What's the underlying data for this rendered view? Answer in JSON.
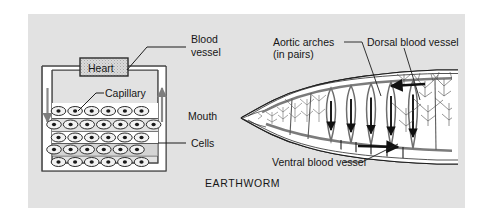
{
  "figure": {
    "caption": "EARTHWORM",
    "panel_color": "#e2e2e2",
    "background_color": "#ffffff",
    "ink_color": "#161616",
    "vessel_color": "#6b6b6b"
  },
  "left_diagram": {
    "name": "generalized-closed-circulation-schematic",
    "heart_label": "Heart",
    "labels": {
      "blood_vessel_line1": "Blood",
      "blood_vessel_line2": "vessel",
      "capillary": "Capillary",
      "cells": "Cells"
    },
    "flow": {
      "left_arrow_direction": "down",
      "right_arrow_direction": "up"
    },
    "cell_rows": [
      6,
      7,
      7,
      6,
      7
    ],
    "cell_row_count": 5
  },
  "right_diagram": {
    "name": "earthworm-anterior-circulation",
    "labels": {
      "aortic_arches_line1": "Aortic arches",
      "aortic_arches_line2": "(in pairs)",
      "dorsal_blood_vessel": "Dorsal blood vessel",
      "ventral_blood_vessel": "Ventral blood vessel",
      "mouth": "Mouth"
    },
    "aortic_arch_count": 5,
    "arch_arrow_direction": "down",
    "dorsal_arrow_direction": "left",
    "ventral_arrow_direction": "right"
  }
}
